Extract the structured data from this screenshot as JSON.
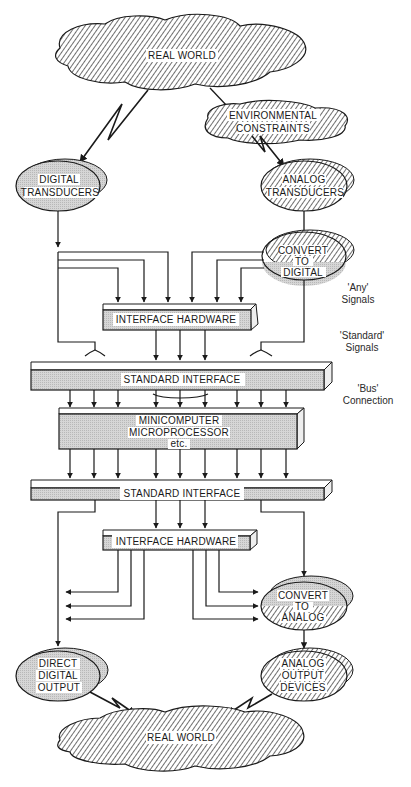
{
  "diagram": {
    "type": "block-diagram",
    "colors": {
      "line": "#1a1a1a",
      "hatch": "#222222",
      "shade": "#cfcfcf",
      "box_fill": "#d4d4d4"
    },
    "top_cloud": {
      "label": "REAL WORLD"
    },
    "env_cloud": {
      "label_line1": "ENVIRONMENTAL",
      "label_line2": "CONSTRAINTS"
    },
    "digital_transducers": {
      "label_line1": "DIGITAL",
      "label_line2": "TRANSDUCERS"
    },
    "analog_transducers": {
      "label_line1": "ANALOG",
      "label_line2": "TRANSDUCERS"
    },
    "convert_to_digital": {
      "label_line1": "CONVERT",
      "label_line2": "TO",
      "label_line3": "DIGITAL"
    },
    "interface_hw_top": {
      "label": "INTERFACE HARDWARE"
    },
    "standard_interface_top": {
      "label": "STANDARD INTERFACE"
    },
    "computer": {
      "label_line1": "MINICOMPUTER",
      "label_line2": "MICROPROCESSOR",
      "label_line3": "etc."
    },
    "standard_interface_bottom": {
      "label": "STANDARD INTERFACE"
    },
    "interface_hw_bottom": {
      "label": "INTERFACE HARDWARE"
    },
    "convert_to_analog": {
      "label_line1": "CONVERT",
      "label_line2": "TO",
      "label_line3": "ANALOG"
    },
    "direct_digital_output": {
      "label_line1": "DIRECT",
      "label_line2": "DIGITAL",
      "label_line3": "OUTPUT"
    },
    "analog_output_devices": {
      "label_line1": "ANALOG",
      "label_line2": "OUTPUT",
      "label_line3": "DEVICES"
    },
    "bottom_cloud": {
      "label": "REAL WORLD"
    },
    "side_labels": {
      "any_line1": "'Any'",
      "any_line2": "Signals",
      "standard_line1": "'Standard'",
      "standard_line2": "Signals",
      "bus_line1": "'Bus'",
      "bus_line2": "Connection"
    }
  }
}
